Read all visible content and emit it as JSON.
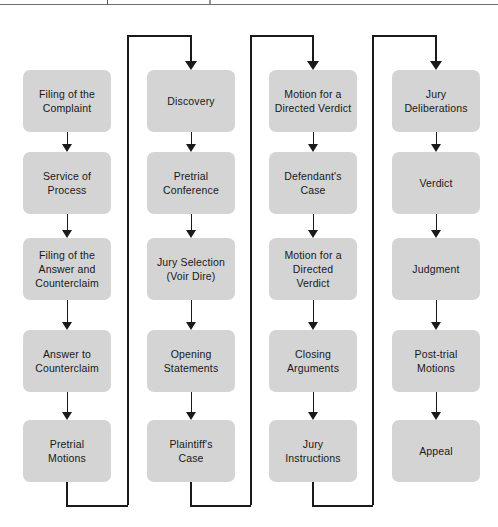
{
  "page": {
    "background_color": "#ffffff",
    "node_fill_color": "#d4d4d4",
    "connector_color": "#1a1a1a",
    "text_color": "#18181a",
    "top_rule": true
  },
  "diagram": {
    "type": "flowchart",
    "orientation": "column-snake",
    "column_count": 4,
    "rows_per_column": 5,
    "columns": [
      {
        "index": 0,
        "has_inbound_elbow": false,
        "has_outbound_elbow": true,
        "nodes": [
          {
            "id": "n1",
            "label": "Filing of the\nComplaint"
          },
          {
            "id": "n2",
            "label": "Service of\nProcess"
          },
          {
            "id": "n3",
            "label": "Filing of the\nAnswer and\nCounterclaim"
          },
          {
            "id": "n4",
            "label": "Answer to\nCounterclaim"
          },
          {
            "id": "n5",
            "label": "Pretrial\nMotions"
          }
        ]
      },
      {
        "index": 1,
        "has_inbound_elbow": true,
        "has_outbound_elbow": true,
        "nodes": [
          {
            "id": "n6",
            "label": "Discovery"
          },
          {
            "id": "n7",
            "label": "Pretrial\nConference"
          },
          {
            "id": "n8",
            "label": "Jury Selection\n(Voir Dire)"
          },
          {
            "id": "n9",
            "label": "Opening\nStatements"
          },
          {
            "id": "n10",
            "label": "Plaintiff's\nCase"
          }
        ]
      },
      {
        "index": 2,
        "has_inbound_elbow": true,
        "has_outbound_elbow": true,
        "nodes": [
          {
            "id": "n11",
            "label": "Motion for a\nDirected Verdict"
          },
          {
            "id": "n12",
            "label": "Defendant's\nCase"
          },
          {
            "id": "n13",
            "label": "Motion for a\nDirected\nVerdict"
          },
          {
            "id": "n14",
            "label": "Closing\nArguments"
          },
          {
            "id": "n15",
            "label": "Jury\nInstructions"
          }
        ]
      },
      {
        "index": 3,
        "has_inbound_elbow": true,
        "has_outbound_elbow": false,
        "nodes": [
          {
            "id": "n16",
            "label": "Jury\nDeliberations"
          },
          {
            "id": "n17",
            "label": "Verdict"
          },
          {
            "id": "n18",
            "label": "Judgment"
          },
          {
            "id": "n19",
            "label": "Post-trial\nMotions"
          },
          {
            "id": "n20",
            "label": "Appeal"
          }
        ]
      }
    ],
    "sequence": [
      "Filing of the Complaint",
      "Service of Process",
      "Filing of the Answer and Counterclaim",
      "Answer to Counterclaim",
      "Pretrial Motions",
      "Discovery",
      "Pretrial Conference",
      "Jury Selection (Voir Dire)",
      "Opening Statements",
      "Plaintiff's Case",
      "Motion for a Directed Verdict",
      "Defendant's Case",
      "Motion for a Directed Verdict",
      "Closing Arguments",
      "Jury Instructions",
      "Jury Deliberations",
      "Verdict",
      "Judgment",
      "Post-trial Motions",
      "Appeal"
    ]
  }
}
